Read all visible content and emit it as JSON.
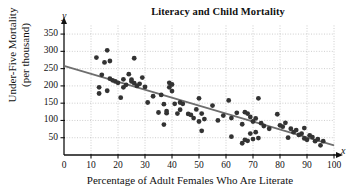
{
  "chart_data": {
    "type": "scatter",
    "title": "Literacy and Child Mortality",
    "xlabel": "Percentage of Adult Females Who Are Literate",
    "ylabel_line1": "Under-Five Mortality",
    "ylabel_line2": "(per thousand)",
    "x_axis_letter": "x",
    "y_axis_letter": "y",
    "xlim": [
      0,
      100
    ],
    "ylim": [
      0,
      375
    ],
    "xticks": [
      0,
      10,
      20,
      30,
      40,
      50,
      60,
      70,
      80,
      90,
      100
    ],
    "yticks": [
      50,
      100,
      150,
      200,
      250,
      300,
      350
    ],
    "grid": true,
    "grid_style": "dotted",
    "grid_color": "#b8b8b8",
    "point_color": "#333333",
    "point_radius": 2.4,
    "line_color": "#6e6e6e",
    "trendline": {
      "label": "least-squares regression line",
      "x": [
        0,
        100
      ],
      "y": [
        258,
        28
      ],
      "slope": -2.3,
      "intercept": 258
    },
    "points": [
      [
        12,
        282
      ],
      [
        13,
        178
      ],
      [
        13,
        196
      ],
      [
        14,
        232
      ],
      [
        15,
        268
      ],
      [
        16,
        303
      ],
      [
        16,
        186
      ],
      [
        17,
        272
      ],
      [
        17,
        221
      ],
      [
        18,
        216
      ],
      [
        19,
        213
      ],
      [
        20,
        209
      ],
      [
        21,
        166
      ],
      [
        22,
        219
      ],
      [
        22,
        196
      ],
      [
        23,
        203
      ],
      [
        24,
        234
      ],
      [
        25,
        213
      ],
      [
        25,
        218
      ],
      [
        26,
        280
      ],
      [
        26,
        208
      ],
      [
        27,
        200
      ],
      [
        28,
        206
      ],
      [
        29,
        224
      ],
      [
        30,
        197
      ],
      [
        31,
        152
      ],
      [
        33,
        170
      ],
      [
        35,
        123
      ],
      [
        36,
        174
      ],
      [
        37,
        147
      ],
      [
        37,
        88
      ],
      [
        38,
        121
      ],
      [
        38,
        127
      ],
      [
        39,
        209
      ],
      [
        39,
        196
      ],
      [
        40,
        204
      ],
      [
        40,
        185
      ],
      [
        41,
        148
      ],
      [
        42,
        120
      ],
      [
        43,
        131
      ],
      [
        43,
        152
      ],
      [
        44,
        148
      ],
      [
        46,
        119
      ],
      [
        47,
        116
      ],
      [
        48,
        107
      ],
      [
        49,
        132
      ],
      [
        50,
        97
      ],
      [
        50,
        164
      ],
      [
        51,
        120
      ],
      [
        51,
        70
      ],
      [
        52,
        104
      ],
      [
        55,
        143
      ],
      [
        57,
        100
      ],
      [
        59,
        114
      ],
      [
        61,
        158
      ],
      [
        62,
        53
      ],
      [
        62,
        107
      ],
      [
        64,
        122
      ],
      [
        66,
        89
      ],
      [
        66,
        34
      ],
      [
        67,
        124
      ],
      [
        67,
        44
      ],
      [
        68,
        120
      ],
      [
        68,
        41
      ],
      [
        69,
        110
      ],
      [
        69,
        62
      ],
      [
        70,
        97
      ],
      [
        70,
        46
      ],
      [
        71,
        106
      ],
      [
        71,
        66
      ],
      [
        72,
        164
      ],
      [
        72,
        49
      ],
      [
        73,
        92
      ],
      [
        74,
        84
      ],
      [
        76,
        76
      ],
      [
        79,
        118
      ],
      [
        80,
        86
      ],
      [
        81,
        82
      ],
      [
        82,
        93
      ],
      [
        83,
        50
      ],
      [
        84,
        76
      ],
      [
        85,
        66
      ],
      [
        86,
        72
      ],
      [
        87,
        58
      ],
      [
        88,
        62
      ],
      [
        89,
        78
      ],
      [
        89,
        48
      ],
      [
        90,
        44
      ],
      [
        91,
        57
      ],
      [
        92,
        52
      ],
      [
        93,
        40
      ],
      [
        94,
        46
      ],
      [
        95,
        28
      ],
      [
        96,
        40
      ]
    ]
  }
}
